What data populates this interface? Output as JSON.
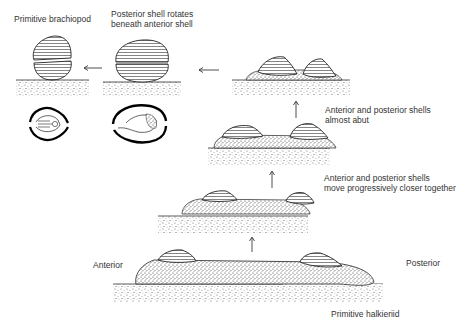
{
  "diagram": {
    "labels": {
      "primitive_brachiopod": "Primitive brachiopod",
      "rotates_line1": "Posterior shell rotates",
      "rotates_line2": "beneath anterior shell",
      "abut_line1": "Anterior and posterior shells",
      "abut_line2": "almost abut",
      "closer_line1": "Anterior and posterior shells",
      "closer_line2": "move progressively closer together",
      "anterior": "Anterior",
      "posterior": "Posterior",
      "primitive_halkieriid": "Primitive halkieriid"
    },
    "stages": [
      {
        "id": 1,
        "name": "Primitive halkieriid"
      },
      {
        "id": 2,
        "name": "Shells move closer together"
      },
      {
        "id": 3,
        "name": "Shells almost abut"
      },
      {
        "id": 4,
        "name": "Posterior shell rotates beneath anterior shell"
      },
      {
        "id": 5,
        "name": "Primitive brachiopod"
      }
    ]
  }
}
